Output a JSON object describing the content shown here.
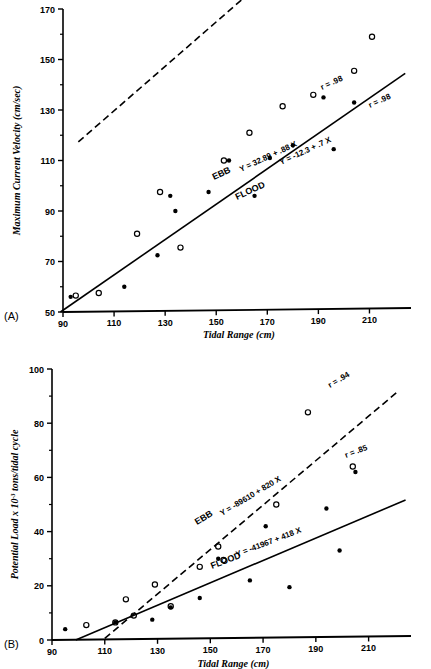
{
  "figure": {
    "panels": [
      {
        "letter": "(A)",
        "xlabel": "Tidal Range (cm)",
        "ylabel": "Maximum Current Velocity  (cm/sec)"
      },
      {
        "letter": "(B)",
        "xlabel": "Tidal Range (cm)",
        "ylabel_pre": "Potential Load x 10",
        "ylabel_sup": "-3",
        "ylabel_post": " tons/tidal cycle"
      }
    ]
  },
  "chart_data": [
    {
      "type": "scatter",
      "panel": "(A)",
      "title": "",
      "xlabel": "Tidal Range (cm)",
      "ylabel": "Maximum Current Velocity  (cm/sec)",
      "xlim": [
        90,
        220
      ],
      "ylim": [
        50,
        170
      ],
      "xticks": [
        90,
        110,
        130,
        150,
        170,
        190,
        210
      ],
      "yticks": [
        50,
        70,
        90,
        110,
        130,
        150,
        170
      ],
      "yminorticks": [
        60,
        80,
        100,
        120,
        140,
        160
      ],
      "grid": false,
      "legend": "inline-labels",
      "series": [
        {
          "name": "EBB",
          "marker": "open-circle",
          "linestyle": "dashed",
          "equation": "Y = 32.89 + .88 X",
          "r_label": "r = .98",
          "slope": 0.88,
          "intercept": 32.89,
          "points": [
            [
              95,
              56.5
            ],
            [
              104,
              57.5
            ],
            [
              119,
              81
            ],
            [
              128,
              97.5
            ],
            [
              136,
              75.5
            ],
            [
              153,
              110
            ],
            [
              163,
              121
            ],
            [
              176,
              131.5
            ],
            [
              188,
              136
            ],
            [
              204,
              145.5
            ],
            [
              211,
              159
            ]
          ]
        },
        {
          "name": "FLOOD",
          "marker": "filled-circle",
          "linestyle": "solid",
          "equation": "Y = -12.3 + .7 X",
          "r_label": "r = .98",
          "slope": 0.7,
          "intercept": -12.3,
          "points": [
            [
              93,
              56
            ],
            [
              114,
              60
            ],
            [
              127,
              72.5
            ],
            [
              132,
              96
            ],
            [
              134,
              90
            ],
            [
              147,
              97.5
            ],
            [
              155,
              110
            ],
            [
              165,
              96
            ],
            [
              171,
              111
            ],
            [
              180,
              116
            ],
            [
              192,
              135
            ],
            [
              196,
              114.5
            ],
            [
              204,
              133
            ]
          ]
        }
      ]
    },
    {
      "type": "scatter",
      "panel": "(B)",
      "title": "",
      "xlabel": "Tidal Range (cm)",
      "ylabel": "Potential Load x 10-3 tons/tidal cycle",
      "xlim": [
        90,
        220
      ],
      "ylim": [
        0,
        100
      ],
      "xticks": [
        90,
        110,
        130,
        150,
        170,
        190,
        210
      ],
      "yticks": [
        0,
        20,
        40,
        60,
        80,
        100
      ],
      "yminorticks": [
        10,
        30,
        50,
        70,
        90
      ],
      "grid": false,
      "legend": "inline-labels",
      "series": [
        {
          "name": "EBB",
          "marker": "open-circle",
          "linestyle": "dashed",
          "equation": "Y = -89610 + 820 X",
          "r_label": "r = .94",
          "slope": 820,
          "intercept": -89610,
          "points": [
            [
              103,
              5.5
            ],
            [
              114,
              6.5
            ],
            [
              118,
              15
            ],
            [
              121,
              9
            ],
            [
              129,
              20.5
            ],
            [
              135,
              12.5
            ],
            [
              146,
              27
            ],
            [
              153,
              34.5
            ],
            [
              155,
              29.5
            ],
            [
              175,
              50
            ],
            [
              187,
              84
            ],
            [
              204,
              64
            ],
            [
              206,
              100.5
            ]
          ]
        },
        {
          "name": "FLOOD",
          "marker": "filled-circle",
          "linestyle": "solid",
          "equation": "Y = -41967 + 418 X",
          "r_label": "r = .85",
          "slope": 418,
          "intercept": -41967,
          "points": [
            [
              95,
              4
            ],
            [
              114,
              6.5
            ],
            [
              128,
              7.5
            ],
            [
              135,
              12
            ],
            [
              146,
              15.5
            ],
            [
              153,
              30
            ],
            [
              165,
              22
            ],
            [
              171,
              42
            ],
            [
              180,
              19.5
            ],
            [
              194,
              48.5
            ],
            [
              199,
              33
            ],
            [
              205,
              62
            ]
          ]
        }
      ]
    }
  ]
}
